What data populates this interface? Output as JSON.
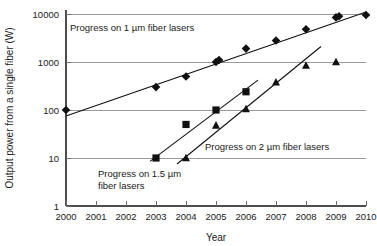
{
  "chart_data": {
    "type": "scatter",
    "title": "",
    "xlabel": "Year",
    "ylabel": "Output power from a single fiber (W)",
    "xlim": [
      2000,
      2010
    ],
    "ylim": [
      1,
      10000
    ],
    "yscale": "log",
    "grid": true,
    "legend": "none",
    "xticklabels": [
      "2000",
      "2001",
      "2002",
      "2003",
      "2004",
      "2005",
      "2006",
      "2007",
      "2008",
      "2009",
      "2010"
    ],
    "xtickvalues": [
      2000,
      2001,
      2002,
      2003,
      2004,
      2005,
      2006,
      2007,
      2008,
      2009,
      2010
    ],
    "yticklabels": [
      "1",
      "10",
      "100",
      "1000",
      "10000"
    ],
    "ytickvalues": [
      1,
      10,
      100,
      1000,
      10000
    ],
    "series": [
      {
        "name": "Progress on 1 µm fiber lasers",
        "marker": "diamond",
        "color": "#111111",
        "points": [
          {
            "x": 2000,
            "y": 100
          },
          {
            "x": 2003,
            "y": 300
          },
          {
            "x": 2004,
            "y": 500
          },
          {
            "x": 2005,
            "y": 1000
          },
          {
            "x": 2005.1,
            "y": 1100
          },
          {
            "x": 2006,
            "y": 1900
          },
          {
            "x": 2007,
            "y": 2800
          },
          {
            "x": 2008,
            "y": 4800
          },
          {
            "x": 2009,
            "y": 8500
          },
          {
            "x": 2009.1,
            "y": 9000
          },
          {
            "x": 2010,
            "y": 9500
          }
        ],
        "trendline": {
          "x0": 2000,
          "y0": 75,
          "x1": 2010,
          "y1": 11000
        }
      },
      {
        "name": "Progress on 1.5 µm fiber lasers",
        "marker": "square",
        "color": "#111111",
        "points": [
          {
            "x": 2003,
            "y": 10
          },
          {
            "x": 2004,
            "y": 50
          },
          {
            "x": 2005,
            "y": 100
          },
          {
            "x": 2006,
            "y": 240
          }
        ],
        "trendline": {
          "x0": 2002.8,
          "y0": 8.5,
          "x1": 2006.4,
          "y1": 420
        }
      },
      {
        "name": "Progress on 2 µm fiber lasers",
        "marker": "triangle",
        "color": "#111111",
        "points": [
          {
            "x": 2004,
            "y": 10
          },
          {
            "x": 2005,
            "y": 48
          },
          {
            "x": 2006,
            "y": 105
          },
          {
            "x": 2007,
            "y": 380
          },
          {
            "x": 2008,
            "y": 850
          },
          {
            "x": 2009,
            "y": 1000
          }
        ],
        "trendline": {
          "x0": 2003.7,
          "y0": 7.5,
          "x1": 2008.5,
          "y1": 2100
        }
      }
    ],
    "annotations": [
      {
        "id": "annot-1um",
        "text": "Progress on 1 µm fiber lasers",
        "x": 70,
        "y": 31
      },
      {
        "id": "annot-15um-line1",
        "text": "Progress on 1.5 µm",
        "x": 98,
        "y": 177
      },
      {
        "id": "annot-15um-line2",
        "text": "fiber lasers",
        "x": 98,
        "y": 189
      },
      {
        "id": "annot-2um",
        "text": "Progress on 2 µm fiber lasers",
        "x": 205,
        "y": 150
      }
    ]
  }
}
